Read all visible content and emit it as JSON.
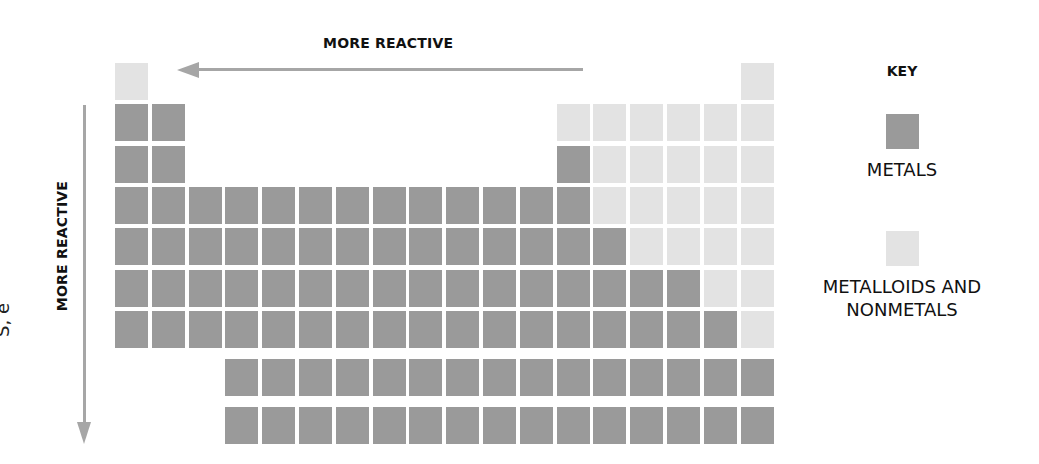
{
  "diagram": {
    "title_horizontal": "MORE REACTIVE",
    "title_vertical": "MORE REACTIVE",
    "cutoff_left_text": "S, e",
    "colors": {
      "metal": "#9a9a9a",
      "nonmetal": "#e3e3e3",
      "arrow": "#a6a6a6"
    },
    "key": {
      "title": "KEY",
      "items": [
        {
          "label": "METALS",
          "category": "metal"
        },
        {
          "label": "METALLOIDS AND NONMETALS",
          "label_line1": "METALLOIDS AND",
          "label_line2": "NONMETALS",
          "category": "nonmetal"
        }
      ]
    },
    "table": {
      "main_rows": [
        {
          "period": 1,
          "cells": [
            [
              1,
              "N"
            ],
            [
              18,
              "N"
            ]
          ]
        },
        {
          "period": 2,
          "cells": [
            [
              1,
              "M"
            ],
            [
              2,
              "M"
            ],
            [
              13,
              "N"
            ],
            [
              14,
              "N"
            ],
            [
              15,
              "N"
            ],
            [
              16,
              "N"
            ],
            [
              17,
              "N"
            ],
            [
              18,
              "N"
            ]
          ]
        },
        {
          "period": 3,
          "cells": [
            [
              1,
              "M"
            ],
            [
              2,
              "M"
            ],
            [
              13,
              "M"
            ],
            [
              14,
              "N"
            ],
            [
              15,
              "N"
            ],
            [
              16,
              "N"
            ],
            [
              17,
              "N"
            ],
            [
              18,
              "N"
            ]
          ]
        },
        {
          "period": 4,
          "cells": [
            [
              1,
              "M"
            ],
            [
              2,
              "M"
            ],
            [
              3,
              "M"
            ],
            [
              4,
              "M"
            ],
            [
              5,
              "M"
            ],
            [
              6,
              "M"
            ],
            [
              7,
              "M"
            ],
            [
              8,
              "M"
            ],
            [
              9,
              "M"
            ],
            [
              10,
              "M"
            ],
            [
              11,
              "M"
            ],
            [
              12,
              "M"
            ],
            [
              13,
              "M"
            ],
            [
              14,
              "N"
            ],
            [
              15,
              "N"
            ],
            [
              16,
              "N"
            ],
            [
              17,
              "N"
            ],
            [
              18,
              "N"
            ]
          ]
        },
        {
          "period": 5,
          "cells": [
            [
              1,
              "M"
            ],
            [
              2,
              "M"
            ],
            [
              3,
              "M"
            ],
            [
              4,
              "M"
            ],
            [
              5,
              "M"
            ],
            [
              6,
              "M"
            ],
            [
              7,
              "M"
            ],
            [
              8,
              "M"
            ],
            [
              9,
              "M"
            ],
            [
              10,
              "M"
            ],
            [
              11,
              "M"
            ],
            [
              12,
              "M"
            ],
            [
              13,
              "M"
            ],
            [
              14,
              "M"
            ],
            [
              15,
              "N"
            ],
            [
              16,
              "N"
            ],
            [
              17,
              "N"
            ],
            [
              18,
              "N"
            ]
          ]
        },
        {
          "period": 6,
          "cells": [
            [
              1,
              "M"
            ],
            [
              2,
              "M"
            ],
            [
              3,
              "M"
            ],
            [
              4,
              "M"
            ],
            [
              5,
              "M"
            ],
            [
              6,
              "M"
            ],
            [
              7,
              "M"
            ],
            [
              8,
              "M"
            ],
            [
              9,
              "M"
            ],
            [
              10,
              "M"
            ],
            [
              11,
              "M"
            ],
            [
              12,
              "M"
            ],
            [
              13,
              "M"
            ],
            [
              14,
              "M"
            ],
            [
              15,
              "M"
            ],
            [
              16,
              "M"
            ],
            [
              17,
              "N"
            ],
            [
              18,
              "N"
            ]
          ]
        },
        {
          "period": 7,
          "cells": [
            [
              1,
              "M"
            ],
            [
              2,
              "M"
            ],
            [
              3,
              "M"
            ],
            [
              4,
              "M"
            ],
            [
              5,
              "M"
            ],
            [
              6,
              "M"
            ],
            [
              7,
              "M"
            ],
            [
              8,
              "M"
            ],
            [
              9,
              "M"
            ],
            [
              10,
              "M"
            ],
            [
              11,
              "M"
            ],
            [
              12,
              "M"
            ],
            [
              13,
              "M"
            ],
            [
              14,
              "M"
            ],
            [
              15,
              "M"
            ],
            [
              16,
              "M"
            ],
            [
              17,
              "M"
            ],
            [
              18,
              "N"
            ]
          ]
        }
      ],
      "f_block_rows": [
        {
          "name": "lanthanides",
          "count": 15,
          "category": "M"
        },
        {
          "name": "actinides",
          "count": 15,
          "category": "M"
        }
      ]
    }
  }
}
